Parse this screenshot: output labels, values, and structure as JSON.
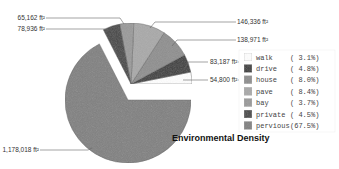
{
  "chart_data": {
    "type": "pie",
    "title": "Environmental Density",
    "unit": "ft²",
    "slices": [
      {
        "name": "walk",
        "value": 54800,
        "value_label": "54,800 ft²",
        "percent_label": "( 3.1%)",
        "color": "#ffffff"
      },
      {
        "name": "drive",
        "value": 83187,
        "value_label": "83,187 ft²",
        "percent_label": "( 4.8%)",
        "color": "#3a3a3a"
      },
      {
        "name": "house",
        "value": 138971,
        "value_label": "138,971 ft²",
        "percent_label": "( 8.0%)",
        "color": "#8e8e8e"
      },
      {
        "name": "pave",
        "value": 146336,
        "value_label": "146,336 ft²",
        "percent_label": "( 8.4%)",
        "color": "#a9a9a9"
      },
      {
        "name": "bay",
        "value": 65162,
        "value_label": "65,162 ft²",
        "percent_label": "( 3.7%)",
        "color": "#9a9a9a"
      },
      {
        "name": "private",
        "value": 78936,
        "value_label": "78,936 ft²",
        "percent_label": "( 4.5%)",
        "color": "#454545"
      },
      {
        "name": "pervious",
        "value": 1178018,
        "value_label": "1,178,018 ft²",
        "percent_label": "(67.5%)",
        "color": "#808080"
      }
    ],
    "legend_position": "right",
    "exploded": "pervious"
  }
}
